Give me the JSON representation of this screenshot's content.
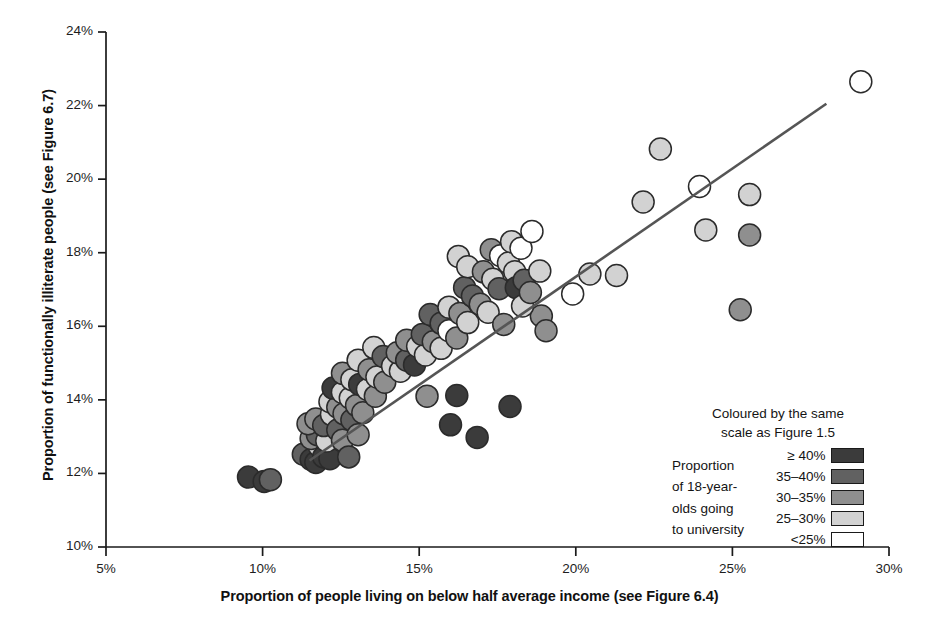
{
  "chart_data": {
    "type": "scatter",
    "title": "",
    "xlabel": "Proportion of people living on below half average income (see Figure 6.4)",
    "ylabel": "Proportion of functionally illiterate people (see Figure 6.7)",
    "xlim": [
      5,
      30
    ],
    "ylim": [
      10,
      24
    ],
    "xticks": [
      5,
      10,
      15,
      20,
      25,
      30
    ],
    "xtick_labels": [
      "5%",
      "10%",
      "15%",
      "20%",
      "25%",
      "30%"
    ],
    "yticks": [
      10,
      12,
      14,
      16,
      18,
      20,
      22,
      24
    ],
    "ytick_labels": [
      "10%",
      "12%",
      "14%",
      "16%",
      "18%",
      "20%",
      "22%",
      "24%"
    ],
    "grid": false,
    "legend_position": "bottom-right",
    "marker": "circle",
    "marker_radius_px": 11,
    "trendline": {
      "type": "linear",
      "x_start": 11.5,
      "y_start": 12.35,
      "x_end": 28.0,
      "y_end": 22.05,
      "color": "#555555",
      "width_px": 2.6
    },
    "color_scale": {
      "label_top": "Coloured by the same",
      "label_top2": "scale as Figure 1.5",
      "description": [
        "Proportion",
        "of 18-year-",
        "olds going",
        "to university"
      ],
      "bins": [
        {
          "label": "≥ 40%",
          "color": "#3b3b3b"
        },
        {
          "label": "35–40%",
          "color": "#616161"
        },
        {
          "label": "30–35%",
          "color": "#8f8f8f"
        },
        {
          "label": "25–30%",
          "color": "#d2d2d2"
        },
        {
          "label": "<25%",
          "color": "#ffffff"
        }
      ]
    },
    "series": [
      {
        "name": "Local areas",
        "points": [
          {
            "x": 9.55,
            "y": 11.9,
            "bin": 0
          },
          {
            "x": 10.05,
            "y": 11.78,
            "bin": 0
          },
          {
            "x": 10.25,
            "y": 11.83,
            "bin": 1
          },
          {
            "x": 11.3,
            "y": 12.52,
            "bin": 1
          },
          {
            "x": 11.55,
            "y": 12.38,
            "bin": 0
          },
          {
            "x": 11.7,
            "y": 12.3,
            "bin": 0
          },
          {
            "x": 11.8,
            "y": 12.75,
            "bin": 3
          },
          {
            "x": 11.55,
            "y": 12.95,
            "bin": 2
          },
          {
            "x": 11.75,
            "y": 13.05,
            "bin": 1
          },
          {
            "x": 11.95,
            "y": 12.45,
            "bin": 0
          },
          {
            "x": 12.15,
            "y": 12.4,
            "bin": 0
          },
          {
            "x": 12.05,
            "y": 12.88,
            "bin": 3
          },
          {
            "x": 11.45,
            "y": 13.35,
            "bin": 2
          },
          {
            "x": 11.7,
            "y": 13.48,
            "bin": 2
          },
          {
            "x": 11.95,
            "y": 13.3,
            "bin": 1
          },
          {
            "x": 12.2,
            "y": 13.6,
            "bin": 3
          },
          {
            "x": 12.4,
            "y": 13.18,
            "bin": 1
          },
          {
            "x": 12.55,
            "y": 12.9,
            "bin": 2
          },
          {
            "x": 12.75,
            "y": 12.45,
            "bin": 1
          },
          {
            "x": 12.15,
            "y": 13.95,
            "bin": 3
          },
          {
            "x": 12.4,
            "y": 13.8,
            "bin": 2
          },
          {
            "x": 12.6,
            "y": 13.62,
            "bin": 2
          },
          {
            "x": 12.85,
            "y": 13.45,
            "bin": 1
          },
          {
            "x": 13.05,
            "y": 13.05,
            "bin": 2
          },
          {
            "x": 12.25,
            "y": 14.32,
            "bin": 0
          },
          {
            "x": 12.55,
            "y": 14.2,
            "bin": 3
          },
          {
            "x": 12.8,
            "y": 14.05,
            "bin": 3
          },
          {
            "x": 13.0,
            "y": 13.85,
            "bin": 2
          },
          {
            "x": 13.2,
            "y": 13.65,
            "bin": 2
          },
          {
            "x": 12.55,
            "y": 14.72,
            "bin": 2
          },
          {
            "x": 12.85,
            "y": 14.55,
            "bin": 3
          },
          {
            "x": 13.1,
            "y": 14.42,
            "bin": 0
          },
          {
            "x": 13.35,
            "y": 14.28,
            "bin": 3
          },
          {
            "x": 13.6,
            "y": 14.1,
            "bin": 2
          },
          {
            "x": 13.05,
            "y": 15.08,
            "bin": 3
          },
          {
            "x": 13.4,
            "y": 14.82,
            "bin": 2
          },
          {
            "x": 13.65,
            "y": 14.62,
            "bin": 3
          },
          {
            "x": 13.9,
            "y": 14.48,
            "bin": 2
          },
          {
            "x": 13.55,
            "y": 15.42,
            "bin": 3
          },
          {
            "x": 13.85,
            "y": 15.18,
            "bin": 1
          },
          {
            "x": 14.15,
            "y": 14.92,
            "bin": 3
          },
          {
            "x": 14.4,
            "y": 14.78,
            "bin": 3
          },
          {
            "x": 14.3,
            "y": 15.28,
            "bin": 2
          },
          {
            "x": 14.6,
            "y": 15.08,
            "bin": 1
          },
          {
            "x": 14.85,
            "y": 14.95,
            "bin": 0
          },
          {
            "x": 14.6,
            "y": 15.62,
            "bin": 2
          },
          {
            "x": 14.95,
            "y": 15.45,
            "bin": 3
          },
          {
            "x": 15.2,
            "y": 15.22,
            "bin": 3
          },
          {
            "x": 15.1,
            "y": 15.78,
            "bin": 1
          },
          {
            "x": 15.45,
            "y": 15.58,
            "bin": 2
          },
          {
            "x": 15.7,
            "y": 15.4,
            "bin": 3
          },
          {
            "x": 15.35,
            "y": 16.32,
            "bin": 1
          },
          {
            "x": 15.7,
            "y": 16.08,
            "bin": 1
          },
          {
            "x": 15.95,
            "y": 15.88,
            "bin": 4
          },
          {
            "x": 16.2,
            "y": 15.68,
            "bin": 2
          },
          {
            "x": 15.95,
            "y": 16.52,
            "bin": 3
          },
          {
            "x": 16.3,
            "y": 16.35,
            "bin": 2
          },
          {
            "x": 16.55,
            "y": 16.1,
            "bin": 3
          },
          {
            "x": 16.45,
            "y": 17.05,
            "bin": 1
          },
          {
            "x": 16.7,
            "y": 16.82,
            "bin": 1
          },
          {
            "x": 16.95,
            "y": 16.6,
            "bin": 2
          },
          {
            "x": 17.2,
            "y": 16.38,
            "bin": 3
          },
          {
            "x": 16.25,
            "y": 17.9,
            "bin": 3
          },
          {
            "x": 16.55,
            "y": 17.62,
            "bin": 3
          },
          {
            "x": 17.05,
            "y": 17.48,
            "bin": 2
          },
          {
            "x": 17.35,
            "y": 17.28,
            "bin": 3
          },
          {
            "x": 17.55,
            "y": 17.02,
            "bin": 1
          },
          {
            "x": 17.3,
            "y": 18.08,
            "bin": 2
          },
          {
            "x": 17.6,
            "y": 17.92,
            "bin": 4
          },
          {
            "x": 17.85,
            "y": 17.72,
            "bin": 3
          },
          {
            "x": 18.05,
            "y": 17.48,
            "bin": 3
          },
          {
            "x": 17.95,
            "y": 18.3,
            "bin": 3
          },
          {
            "x": 18.25,
            "y": 18.12,
            "bin": 4
          },
          {
            "x": 18.1,
            "y": 17.05,
            "bin": 0
          },
          {
            "x": 18.35,
            "y": 17.25,
            "bin": 1
          },
          {
            "x": 18.6,
            "y": 18.58,
            "bin": 4
          },
          {
            "x": 18.85,
            "y": 17.5,
            "bin": 3
          },
          {
            "x": 18.9,
            "y": 16.28,
            "bin": 2
          },
          {
            "x": 19.05,
            "y": 15.88,
            "bin": 2
          },
          {
            "x": 18.3,
            "y": 16.55,
            "bin": 3
          },
          {
            "x": 18.55,
            "y": 16.92,
            "bin": 2
          },
          {
            "x": 17.7,
            "y": 16.05,
            "bin": 2
          },
          {
            "x": 15.25,
            "y": 14.1,
            "bin": 2
          },
          {
            "x": 16.2,
            "y": 14.12,
            "bin": 0
          },
          {
            "x": 16.0,
            "y": 13.32,
            "bin": 0
          },
          {
            "x": 16.85,
            "y": 12.98,
            "bin": 0
          },
          {
            "x": 17.9,
            "y": 13.82,
            "bin": 0
          },
          {
            "x": 19.9,
            "y": 16.88,
            "bin": 4
          },
          {
            "x": 20.45,
            "y": 17.42,
            "bin": 3
          },
          {
            "x": 21.3,
            "y": 17.38,
            "bin": 3
          },
          {
            "x": 22.15,
            "y": 19.38,
            "bin": 3
          },
          {
            "x": 22.7,
            "y": 20.82,
            "bin": 3
          },
          {
            "x": 23.95,
            "y": 19.8,
            "bin": 4
          },
          {
            "x": 24.15,
            "y": 18.62,
            "bin": 3
          },
          {
            "x": 25.25,
            "y": 16.45,
            "bin": 2
          },
          {
            "x": 25.55,
            "y": 19.58,
            "bin": 3
          },
          {
            "x": 25.55,
            "y": 18.48,
            "bin": 2
          },
          {
            "x": 29.1,
            "y": 22.65,
            "bin": 4
          }
        ]
      }
    ]
  },
  "axes": {
    "x_title": "Proportion of people living on below half average income (see Figure 6.4)",
    "y_title": "Proportion of functionally illiterate people (see Figure 6.7)"
  },
  "legend": {
    "heading_line1": "Coloured by the same",
    "heading_line2": "scale as Figure 1.5",
    "desc_line1": "Proportion",
    "desc_line2": "of 18-year-",
    "desc_line3": "olds going",
    "desc_line4": "to university",
    "rows": [
      {
        "label": "≥ 40%"
      },
      {
        "label": "35–40%"
      },
      {
        "label": "30–35%"
      },
      {
        "label": "25–30%"
      },
      {
        "label": "<25%"
      }
    ]
  }
}
